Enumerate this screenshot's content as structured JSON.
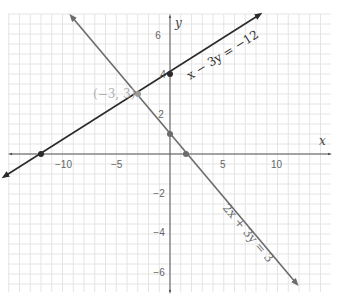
{
  "chart_data": {
    "type": "line",
    "title": "",
    "xlabel": "x",
    "ylabel": "y",
    "xlim": [
      -15.5,
      14.8
    ],
    "ylim": [
      -6.8,
      7.0
    ],
    "grid": true,
    "x_ticks": [
      -10,
      -5,
      5,
      10
    ],
    "y_ticks": [
      6,
      4,
      2,
      -2,
      -4,
      -6
    ],
    "series": [
      {
        "name": "x − 3y = −12",
        "equation": "x - 3y = -12",
        "color": "#2b2b2b",
        "x": [
          -15.3,
          8.2
        ],
        "y": [
          -1.1,
          6.73
        ],
        "points": [
          {
            "x": -12,
            "y": 0
          },
          {
            "x": 0,
            "y": 4
          }
        ]
      },
      {
        "name": "2x + 3y = 3",
        "equation": "2x + 3y = 3",
        "color": "#6b6b6b",
        "x": [
          -9.1,
          11.7
        ],
        "y": [
          7.07,
          -6.8
        ],
        "points": [
          {
            "x": 0,
            "y": 1
          },
          {
            "x": 1.5,
            "y": 0
          }
        ]
      }
    ],
    "annotations": [
      {
        "text": "(−3, 3)",
        "x": -3,
        "y": 3,
        "note": "intersection point"
      }
    ]
  },
  "labels": {
    "x_axis": "x",
    "y_axis": "y",
    "line1": "x − 3y = −12",
    "line2": "2x + 3y = 3",
    "intersection": "(−3, 3)",
    "ticks_x": [
      "−10",
      "−5",
      "5",
      "10"
    ],
    "ticks_y": [
      "6",
      "4",
      "2",
      "−2",
      "−4",
      "−6"
    ]
  },
  "colors": {
    "grid": "#e4e4e4",
    "axis": "#555555",
    "line1": "#2b2b2b",
    "line2": "#6b6b6b",
    "intersection_label": "#b0b0b0"
  }
}
